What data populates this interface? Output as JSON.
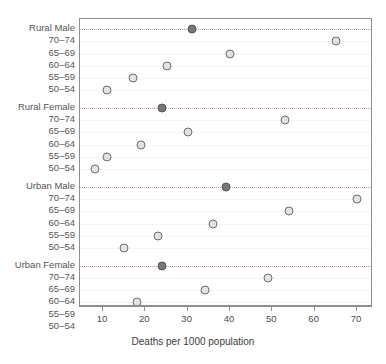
{
  "chart_data": {
    "type": "scatter",
    "title": "",
    "xlabel": "Deaths per 1000 population",
    "ylabel": "",
    "xlim": [
      7,
      72
    ],
    "xticks": [
      10,
      20,
      30,
      40,
      50,
      60,
      70
    ],
    "xticklabels": [
      "10",
      "20",
      "30",
      "40",
      "50",
      "60",
      "70"
    ],
    "grid": "dotted",
    "legend": "none",
    "orientation": "dot-plot",
    "groups": [
      {
        "name": "Rural Male",
        "total_value": 31,
        "total_marker": "filled",
        "rows": [
          {
            "label": "70-74",
            "value": 65
          },
          {
            "label": "65-69",
            "value": 40
          },
          {
            "label": "60-64",
            "value": 25
          },
          {
            "label": "55-59",
            "value": 17
          },
          {
            "label": "50-54",
            "value": 11
          }
        ]
      },
      {
        "name": "Rural Female",
        "total_value": 24,
        "total_marker": "filled",
        "rows": [
          {
            "label": "70-74",
            "value": 53
          },
          {
            "label": "65-69",
            "value": 30
          },
          {
            "label": "60-64",
            "value": 19
          },
          {
            "label": "55-59",
            "value": 11
          },
          {
            "label": "50-54",
            "value": 8
          }
        ]
      },
      {
        "name": "Urban Male",
        "total_value": 39,
        "total_marker": "filled",
        "rows": [
          {
            "label": "70-74",
            "value": 70
          },
          {
            "label": "65-69",
            "value": 54
          },
          {
            "label": "60-64",
            "value": 36
          },
          {
            "label": "55-59",
            "value": 23
          },
          {
            "label": "50-54",
            "value": 15
          }
        ]
      },
      {
        "name": "Urban Female",
        "total_value": 24,
        "total_marker": "filled",
        "rows": [
          {
            "label": "70-74",
            "value": 49
          },
          {
            "label": "65-69",
            "value": 34
          },
          {
            "label": "60-64",
            "value": 18
          },
          {
            "label": "55-59",
            "value": 13
          },
          {
            "label": "50-54",
            "value": 8
          }
        ]
      }
    ]
  },
  "colors": {
    "marker_open_fill": "#e2e2e2",
    "marker_open_stroke": "#6e6e6e",
    "marker_filled": "#777777",
    "group_rule": "#c49a9a",
    "axis": "#8f8f8f",
    "text": "#4a4a4a"
  }
}
